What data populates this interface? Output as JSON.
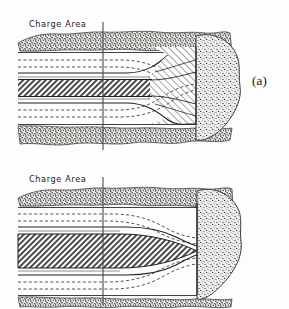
{
  "figure": {
    "domain_note": "Geological / blasting cross-section diagram, two stacked panels",
    "panels": [
      {
        "key": "a",
        "label": "(a)",
        "annotation": "Charge Area",
        "description": "Charge area with hatched zone flaring outward to full seam height at the right face",
        "hatched_zone_shape": "flared",
        "colors": {
          "line": "#2b2b2b",
          "stipple": "#555555",
          "hatch": "#3a3a3a",
          "background": "#ffffff"
        }
      },
      {
        "key": "b",
        "label": "(b)",
        "annotation": "Charge Area",
        "description": "Charge area with hatched zone tapering to a lens point at the right face",
        "hatched_zone_shape": "lens-taper",
        "colors": {
          "line": "#2b2b2b",
          "stipple": "#555555",
          "hatch": "#3a3a3a",
          "background": "#ffffff"
        }
      }
    ],
    "reference_line": {
      "name": "charge-area-reference-line",
      "orientation": "vertical"
    },
    "layers": [
      "overburden-stipple-top",
      "dashed-line-upper-1",
      "dashed-line-upper-2",
      "solid-boundary-upper",
      "hatched-seam-core",
      "solid-boundary-lower",
      "dashed-line-lower-1",
      "dashed-line-lower-2",
      "underburden-stipple-bottom"
    ]
  }
}
